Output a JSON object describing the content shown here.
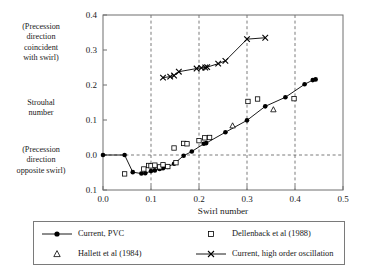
{
  "figure": {
    "side_notes": {
      "coincident": [
        "(Precession",
        "direction",
        "coincident",
        "with swirl)"
      ],
      "strouhal": [
        "Strouhal",
        "number"
      ],
      "opposite": [
        "(Precession",
        "direction",
        "opposite swirl)"
      ]
    }
  },
  "chart_data": {
    "type": "scatter",
    "title": "",
    "xlabel": "Swirl number",
    "ylabel": "Strouhal number",
    "xlim": [
      0.0,
      0.5
    ],
    "ylim": [
      -0.1,
      0.4
    ],
    "xticks": [
      "0.0",
      "0.1",
      "0.2",
      "0.3",
      "0.4",
      "0.5"
    ],
    "xtick_values": [
      0.0,
      0.1,
      0.2,
      0.3,
      0.4,
      0.5
    ],
    "yticks": [
      "0.1",
      "0.0",
      "0.1",
      "0.2",
      "0.3",
      "0.4"
    ],
    "ytick_values": [
      -0.1,
      0.0,
      0.1,
      0.2,
      0.3,
      0.4
    ],
    "grid": "dashed-major",
    "legend_position": "below-axes",
    "series": [
      {
        "name": "Current, PVC",
        "key": "line-filled-circle",
        "marker": "filled-circle",
        "line": true,
        "color": "#000000",
        "x": [
          0.0,
          0.045,
          0.062,
          0.08,
          0.088,
          0.1,
          0.108,
          0.118,
          0.125,
          0.135,
          0.148,
          0.168,
          0.185,
          0.21,
          0.215,
          0.255,
          0.3,
          0.338,
          0.38,
          0.42,
          0.437,
          0.443
        ],
        "y": [
          0.0,
          0.0,
          -0.049,
          -0.053,
          -0.052,
          -0.046,
          -0.044,
          -0.04,
          -0.038,
          -0.034,
          -0.025,
          -0.002,
          0.01,
          0.032,
          0.034,
          0.065,
          0.099,
          0.139,
          0.165,
          0.202,
          0.214,
          0.216
        ]
      },
      {
        "name": "Dellenback et al (1988)",
        "key": "open-square",
        "marker": "open-square",
        "line": false,
        "color": "#000000",
        "x": [
          0.045,
          0.085,
          0.095,
          0.1,
          0.108,
          0.118,
          0.125,
          0.135,
          0.148,
          0.152,
          0.168,
          0.175,
          0.2,
          0.212,
          0.222,
          0.302,
          0.322,
          0.398
        ],
        "y": [
          -0.054,
          -0.04,
          -0.03,
          -0.031,
          -0.029,
          -0.034,
          -0.028,
          -0.033,
          0.02,
          -0.022,
          0.033,
          0.032,
          0.041,
          0.049,
          0.05,
          0.153,
          0.16,
          0.161
        ]
      },
      {
        "name": "Hallett et al (1984)",
        "key": "open-triangle",
        "marker": "open-triangle",
        "line": false,
        "color": "#000000",
        "x": [
          0.27,
          0.355
        ],
        "y": [
          0.084,
          0.13
        ]
      },
      {
        "name": "Current, high order oscillation",
        "key": "line-x-marker",
        "marker": "x-cross",
        "line": true,
        "color": "#000000",
        "x": [
          0.125,
          0.14,
          0.148,
          0.158,
          0.195,
          0.205,
          0.213,
          0.217,
          0.24,
          0.255,
          0.3,
          0.338
        ],
        "y": [
          0.221,
          0.224,
          0.227,
          0.238,
          0.247,
          0.249,
          0.25,
          0.251,
          0.261,
          0.269,
          0.331,
          0.335
        ]
      }
    ],
    "legend_entries": [
      {
        "label": "Current, PVC",
        "key": "line-filled-circle"
      },
      {
        "label": "Dellenback et al (1988)",
        "key": "open-square"
      },
      {
        "label": "Hallett et al (1984)",
        "key": "open-triangle"
      },
      {
        "label": "Current, high order oscillation",
        "key": "line-x-marker"
      }
    ]
  }
}
